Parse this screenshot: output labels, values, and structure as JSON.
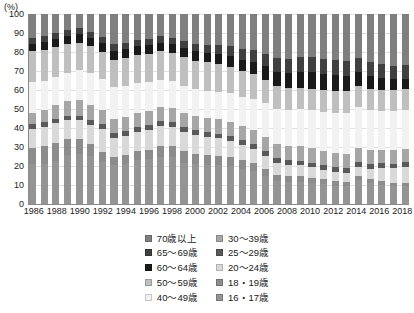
{
  "axis": {
    "unit_label": "(%)",
    "y_ticks": [
      0,
      10,
      20,
      30,
      40,
      50,
      60,
      70,
      80,
      90,
      100
    ],
    "x_tick_labels": [
      "1986",
      "1988",
      "1990",
      "1992",
      "1994",
      "1996",
      "1998",
      "2000",
      "2002",
      "2004",
      "2006",
      "2008",
      "2010",
      "2012",
      "2014",
      "2016",
      "2018"
    ]
  },
  "legend": {
    "left_column": [
      {
        "label": "70歳以上",
        "color": "#7f7f7f"
      },
      {
        "label": "65～69歳",
        "color": "#404040"
      },
      {
        "label": "60～64歳",
        "color": "#1a1a1a"
      },
      {
        "label": "50～59歳",
        "color": "#bfbfbf"
      },
      {
        "label": "40～49歳",
        "color": "#f2f2f2"
      }
    ],
    "right_column": [
      {
        "label": "30～39歳",
        "color": "#a6a6a6"
      },
      {
        "label": "25～29歳",
        "color": "#595959"
      },
      {
        "label": "20～24歳",
        "color": "#d9d9d9"
      },
      {
        "label": "18・19歳",
        "color": "#8c8c8c"
      },
      {
        "label": "16・17歳",
        "color": "#949494"
      }
    ]
  },
  "chart_data": {
    "type": "bar",
    "title": "",
    "xlabel": "",
    "ylabel": "(%)",
    "ylim": [
      0,
      100
    ],
    "grid": true,
    "stacked": true,
    "stack_mode": "percent",
    "legend_position": "bottom",
    "categories": [
      "1986",
      "1987",
      "1988",
      "1989",
      "1990",
      "1991",
      "1992",
      "1993",
      "1994",
      "1995",
      "1996",
      "1997",
      "1998",
      "1999",
      "2000",
      "2001",
      "2002",
      "2003",
      "2004",
      "2005",
      "2006",
      "2007",
      "2008",
      "2009",
      "2010",
      "2011",
      "2012",
      "2013",
      "2014",
      "2015",
      "2016",
      "2017",
      "2018"
    ],
    "series": [
      {
        "name": "16・17歳",
        "color": "#949494",
        "values": [
          21.0,
          21.3,
          22.5,
          26.0,
          26.5,
          25.5,
          22.0,
          20.5,
          21.0,
          23.0,
          23.5,
          25.0,
          24.5,
          21.5,
          21.0,
          20.5,
          20.3,
          20.0,
          18.5,
          17.5,
          15.0,
          12.0,
          11.5,
          11.5,
          11.0,
          10.5,
          9.5,
          9.3,
          12.5,
          11.0,
          10.0,
          9.5,
          9.3
        ]
      },
      {
        "name": "18・19歳",
        "color": "#8c8c8c",
        "values": [
          8.7,
          9.2,
          9.8,
          8.0,
          7.5,
          6.0,
          5.5,
          4.5,
          5.0,
          5.0,
          5.0,
          5.5,
          6.0,
          6.0,
          5.5,
          5.5,
          5.2,
          4.8,
          4.5,
          4.0,
          3.5,
          3.2,
          3.0,
          3.0,
          2.8,
          2.5,
          2.5,
          2.3,
          2.0,
          2.0,
          2.0,
          1.8,
          1.7
        ]
      },
      {
        "name": "20～24歳",
        "color": "#d9d9d9",
        "values": [
          9.8,
          10.0,
          10.2,
          10.0,
          10.0,
          10.0,
          12.0,
          10.0,
          10.0,
          10.0,
          10.5,
          10.5,
          10.0,
          10.0,
          9.8,
          9.5,
          9.0,
          8.5,
          8.0,
          7.5,
          7.0,
          6.5,
          6.0,
          5.8,
          5.5,
          5.0,
          5.0,
          4.8,
          5.0,
          5.5,
          7.0,
          7.5,
          8.5
        ]
      },
      {
        "name": "25～29歳",
        "color": "#595959",
        "values": [
          2.5,
          2.5,
          2.5,
          2.5,
          2.5,
          2.5,
          2.5,
          2.5,
          2.5,
          2.5,
          2.5,
          2.5,
          2.5,
          2.5,
          2.5,
          2.5,
          2.5,
          2.5,
          2.5,
          2.5,
          2.5,
          2.5,
          2.5,
          2.5,
          2.5,
          2.5,
          2.5,
          2.5,
          2.5,
          2.5,
          2.5,
          2.5,
          2.5
        ]
      },
      {
        "name": "30～39歳",
        "color": "#a6a6a6",
        "values": [
          6.0,
          6.5,
          7.0,
          7.5,
          8.0,
          8.0,
          7.5,
          7.5,
          7.5,
          7.5,
          7.5,
          7.5,
          7.5,
          7.5,
          7.5,
          7.5,
          7.5,
          7.5,
          7.5,
          7.5,
          7.5,
          7.5,
          7.5,
          7.5,
          7.5,
          7.5,
          7.5,
          7.5,
          7.5,
          7.5,
          7.0,
          7.0,
          7.0
        ]
      },
      {
        "name": "40～49歳",
        "color": "#f2f2f2",
        "values": [
          16.0,
          15.5,
          15.0,
          15.0,
          16.0,
          17.0,
          16.5,
          16.5,
          16.0,
          15.5,
          15.0,
          14.5,
          14.0,
          14.0,
          14.0,
          14.0,
          14.5,
          15.0,
          15.5,
          16.5,
          17.5,
          18.5,
          19.0,
          19.5,
          20.0,
          20.5,
          21.0,
          21.5,
          21.5,
          21.0,
          20.5,
          20.5,
          20.5
        ]
      },
      {
        "name": "50～59歳",
        "color": "#bfbfbf",
        "values": [
          16.5,
          16.0,
          15.5,
          15.0,
          14.5,
          14.0,
          14.0,
          14.5,
          15.0,
          15.0,
          15.0,
          15.0,
          15.0,
          15.0,
          15.0,
          15.0,
          14.5,
          14.0,
          13.5,
          13.0,
          12.5,
          12.0,
          11.5,
          11.5,
          11.5,
          11.5,
          11.5,
          11.5,
          11.0,
          11.0,
          11.0,
          11.0,
          11.0
        ]
      },
      {
        "name": "60～64歳",
        "color": "#1a1a1a",
        "values": [
          4.0,
          4.2,
          4.3,
          4.5,
          4.5,
          4.5,
          4.5,
          4.5,
          4.5,
          4.5,
          4.5,
          4.5,
          4.5,
          4.8,
          5.0,
          5.2,
          5.5,
          5.8,
          6.0,
          6.5,
          7.0,
          7.5,
          8.0,
          8.3,
          8.5,
          8.5,
          8.5,
          8.0,
          7.5,
          7.0,
          6.5,
          6.0,
          5.5
        ]
      },
      {
        "name": "65～69歳",
        "color": "#404040",
        "values": [
          3.0,
          3.0,
          3.0,
          3.0,
          3.0,
          3.2,
          3.3,
          3.5,
          3.5,
          3.5,
          3.5,
          3.5,
          3.5,
          3.7,
          4.0,
          4.2,
          4.5,
          5.0,
          5.5,
          6.0,
          6.5,
          7.0,
          7.5,
          8.0,
          8.0,
          8.0,
          8.0,
          8.0,
          7.5,
          7.5,
          7.0,
          7.0,
          7.0
        ]
      },
      {
        "name": "70歳以上",
        "color": "#7f7f7f",
        "values": [
          12.5,
          11.8,
          10.2,
          8.5,
          7.5,
          9.3,
          12.2,
          16.0,
          15.0,
          13.5,
          13.0,
          11.5,
          12.5,
          14.0,
          15.7,
          16.1,
          16.5,
          16.9,
          18.5,
          19.0,
          21.0,
          23.3,
          23.5,
          22.4,
          22.7,
          23.5,
          24.0,
          24.6,
          23.0,
          25.0,
          26.5,
          27.2,
          27.0
        ]
      }
    ]
  }
}
